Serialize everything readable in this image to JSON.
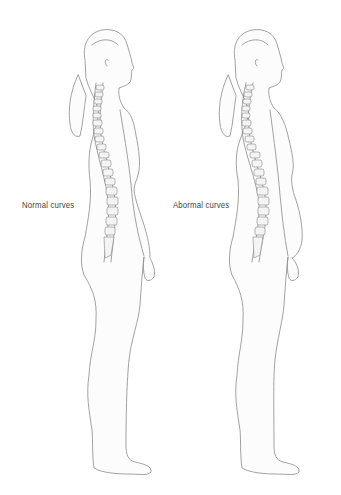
{
  "figure": {
    "type": "anatomical-comparison"
  },
  "panels": [
    {
      "id": "normal",
      "label": "Normal curves",
      "spine_curvature": "normal"
    },
    {
      "id": "abnormal",
      "label": "Abormal curves",
      "spine_curvature": "exaggerated"
    }
  ],
  "colors": {
    "background": "#ffffff",
    "outline": "#8a8a8a",
    "label_text": "#444444"
  }
}
